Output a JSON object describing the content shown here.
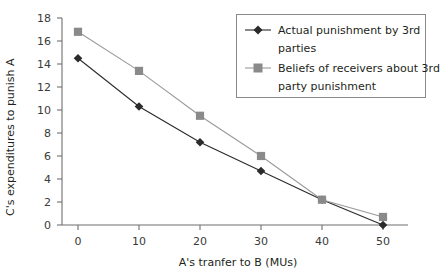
{
  "chart_data": {
    "type": "line",
    "title": "",
    "xlabel": "A's tranfer to B (MUs)",
    "ylabel": "C's expenditures to punish A",
    "x": [
      0,
      10,
      20,
      30,
      40,
      50
    ],
    "xtick_labels": [
      "0",
      "10",
      "20",
      "30",
      "40",
      "50"
    ],
    "ytick_labels": [
      "0",
      "2",
      "4",
      "6",
      "8",
      "10",
      "12",
      "14",
      "16",
      "18"
    ],
    "yticks": [
      0,
      2,
      4,
      6,
      8,
      10,
      12,
      14,
      16,
      18
    ],
    "xlim": [
      -5,
      55
    ],
    "ylim": [
      0,
      18
    ],
    "grid": false,
    "legend_position": "top-right",
    "series": [
      {
        "name": "Actual punishment by 3rd parties",
        "values": [
          14.5,
          10.3,
          7.2,
          4.7,
          2.2,
          0.0
        ],
        "marker": "diamond",
        "color": "#2b2b2b"
      },
      {
        "name": "Beliefs of receivers about 3rd party punishment",
        "values": [
          16.8,
          13.4,
          9.5,
          6.0,
          2.2,
          0.7
        ],
        "marker": "square",
        "color": "#9a9a9a"
      }
    ]
  },
  "legend": {
    "entries": [
      {
        "label_line1": "Actual punishment by 3rd",
        "label_line2": "parties",
        "marker": "diamond-marker",
        "color": "#2b2b2b"
      },
      {
        "label_line1": "Beliefs of receivers about 3rd",
        "label_line2": "party punishment",
        "marker": "square-marker",
        "color": "#9a9a9a"
      }
    ]
  },
  "axes": {
    "x_title": "A's tranfer to B (MUs)",
    "y_title": "C's expenditures to punish A",
    "x_ticks": [
      "0",
      "10",
      "20",
      "30",
      "40",
      "50"
    ],
    "y_ticks": [
      "0",
      "2",
      "4",
      "6",
      "8",
      "10",
      "12",
      "14",
      "16",
      "18"
    ]
  },
  "colors": {
    "actual_series": "#2b2b2b",
    "beliefs_series": "#9a9a9a",
    "axis": "#6f6f6f",
    "text": "#231f20",
    "background": "#ffffff"
  }
}
